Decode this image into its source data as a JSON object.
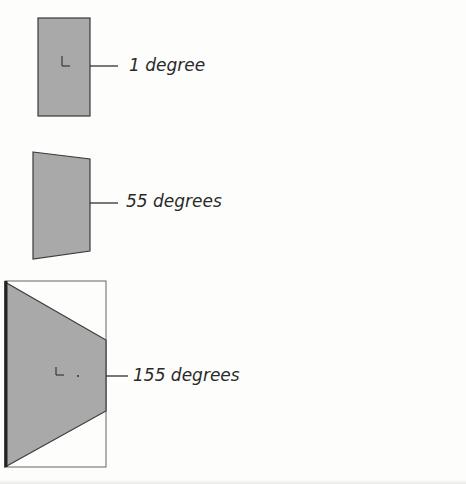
{
  "panels": [
    {
      "label": "1 degree",
      "angle": 1
    },
    {
      "label": "55 degrees",
      "angle": 55
    },
    {
      "label": "155 degrees",
      "angle": 155
    }
  ],
  "colors": {
    "fill": "#a9a9a9",
    "stroke": "#3a3a3a",
    "frame": "#555555"
  }
}
